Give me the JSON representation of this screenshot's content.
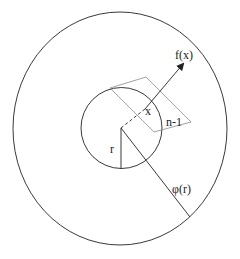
{
  "diagram": {
    "labels": {
      "f_x": "f(x)",
      "x": "x",
      "n_minus_1": "n-1",
      "r": "r",
      "phi_r": "φ(r)"
    },
    "colors": {
      "stroke": "#222222",
      "plane": "#8a8a8a",
      "background": "#ffffff"
    }
  }
}
